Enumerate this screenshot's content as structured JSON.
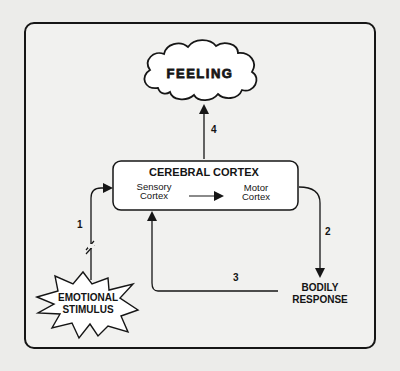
{
  "diagram": {
    "nodes": {
      "feeling": {
        "label": "FEELING",
        "shape": "cloud"
      },
      "cortex": {
        "title": "CEREBRAL CORTEX",
        "sensory_line1": "Sensory",
        "sensory_line2": "Cortex",
        "motor_line1": "Motor",
        "motor_line2": "Cortex",
        "shape": "rounded-rectangle"
      },
      "stimulus": {
        "line1": "EMOTIONAL",
        "line2": "STIMULUS",
        "shape": "starburst"
      },
      "response": {
        "line1": "BODILY",
        "line2": "RESPONSE",
        "shape": "text"
      }
    },
    "edges": [
      {
        "id": "1",
        "label": "1",
        "from": "EMOTIONAL STIMULUS",
        "to": "CEREBRAL CORTEX",
        "note": "broken line (//) indicating interrupted path"
      },
      {
        "id": "2",
        "label": "2",
        "from": "Motor Cortex",
        "to": "BODILY RESPONSE"
      },
      {
        "id": "3",
        "label": "3",
        "from": "BODILY RESPONSE",
        "to": "CEREBRAL CORTEX"
      },
      {
        "id": "4",
        "label": "4",
        "from": "CEREBRAL CORTEX",
        "to": "FEELING"
      },
      {
        "id": "internal",
        "label": "",
        "from": "Sensory Cortex",
        "to": "Motor Cortex"
      }
    ],
    "colors": {
      "background": "#ececea",
      "frame_fill": "#f1f1ef",
      "stroke": "#161616",
      "node_fill": "#ffffff"
    }
  }
}
